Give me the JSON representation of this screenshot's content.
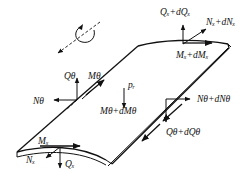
{
  "diagram": {
    "labels": {
      "Qx_dQx": "Qₓ+dQₓ",
      "Nx_dNx": "Nₓ+dNₓ",
      "Mx_dMx": "Mₓ+dMₓ",
      "Qtheta": "Qθ",
      "Mtheta": "Mθ",
      "pr": "pᵣ",
      "Ntheta": "Nθ",
      "Mtheta_dMtheta": "Mθ+dMθ",
      "Ntheta_dNtheta": "Nθ+dNθ",
      "Qtheta_dQtheta": "Qθ+dQθ",
      "Mx": "Mₓ",
      "Nx": "Nₓ",
      "Qx": "Qₓ"
    },
    "icons": {
      "rotation": "rotation-axis-icon"
    }
  }
}
